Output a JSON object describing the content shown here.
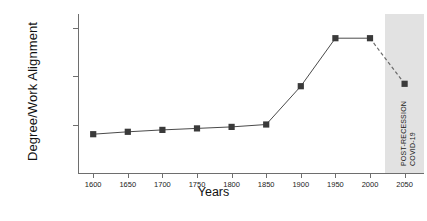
{
  "chart_data": {
    "type": "line",
    "title": "",
    "xlabel": "Years",
    "ylabel": "Degree/Work Alignment",
    "x": [
      1600,
      1650,
      1700,
      1750,
      1800,
      1850,
      1900,
      1950,
      2000,
      2050
    ],
    "xtick_labels": [
      "1600",
      "1650",
      "1700",
      "1750",
      "1800",
      "1850",
      "1900",
      "1950",
      "2000",
      "2050"
    ],
    "ytick_labels": [
      "High",
      "Moderate",
      "Minimal"
    ],
    "ytick_values": [
      3,
      2,
      1
    ],
    "ylim": [
      0,
      3.28
    ],
    "xlim": [
      1578,
      2078
    ],
    "grid": false,
    "legend": null,
    "series": [
      {
        "name": "Degree/Work Alignment",
        "values": [
          0.8,
          0.85,
          0.89,
          0.92,
          0.95,
          1.0,
          1.79,
          2.78,
          2.78,
          1.84
        ],
        "style": "solid-with-dashed-forecast",
        "marker": "filled-square",
        "dashed_from_index": 8
      }
    ],
    "shaded_region": {
      "from_x": 2021,
      "to_x": 2078,
      "color": "#e2e2e2",
      "labels": [
        "POST-RECESSION",
        "COVID-19"
      ]
    },
    "annotations": [
      {
        "text": "POST-RECESSION",
        "orientation": "vertical"
      },
      {
        "text": "COVID-19",
        "orientation": "vertical"
      }
    ]
  }
}
